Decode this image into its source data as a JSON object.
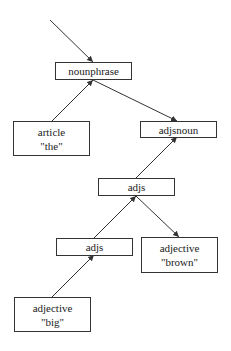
{
  "diagram": {
    "type": "parse-tree",
    "nodes": [
      {
        "id": "nounphrase",
        "label": "nounphrase",
        "value": ""
      },
      {
        "id": "article",
        "label": "article",
        "value": "\"the\""
      },
      {
        "id": "adjsnoun",
        "label": "adjsnoun",
        "value": ""
      },
      {
        "id": "adjs_upper",
        "label": "adjs",
        "value": ""
      },
      {
        "id": "adjs_lower",
        "label": "adjs",
        "value": ""
      },
      {
        "id": "adjective_brown",
        "label": "adjective",
        "value": "\"brown\""
      },
      {
        "id": "adjective_big",
        "label": "adjective",
        "value": "\"big\""
      }
    ],
    "edges": [
      {
        "from": "input",
        "to": "nounphrase"
      },
      {
        "from": "article",
        "to": "nounphrase"
      },
      {
        "from": "nounphrase",
        "to": "adjsnoun"
      },
      {
        "from": "adjs_upper",
        "to": "adjsnoun"
      },
      {
        "from": "adjs_lower",
        "to": "adjs_upper"
      },
      {
        "from": "adjs_upper",
        "to": "adjective_brown"
      },
      {
        "from": "adjective_big",
        "to": "adjs_lower"
      }
    ],
    "colors": {
      "stroke": "#333333",
      "background": "#ffffff"
    }
  }
}
